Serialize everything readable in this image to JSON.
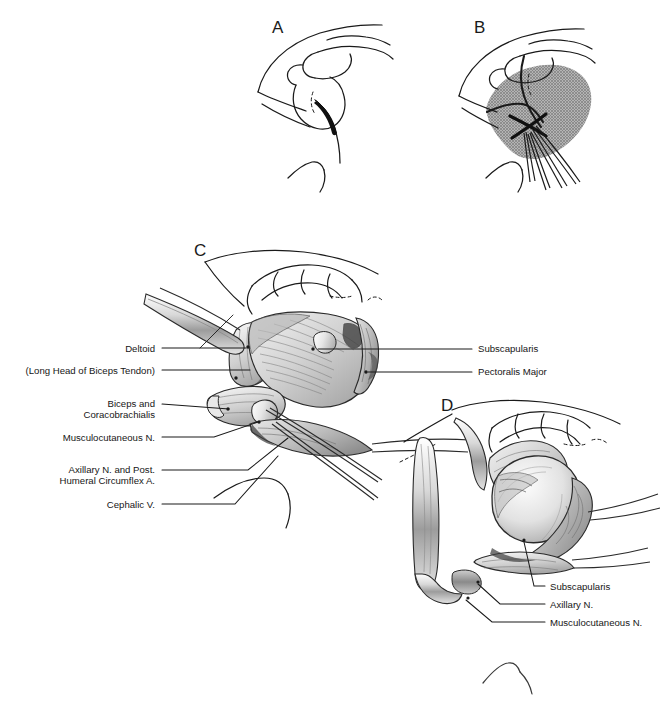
{
  "figure": {
    "background_color": "#ffffff",
    "ink_color": "#1a1a1a",
    "shade_color": "#9a9a9a",
    "width": 665,
    "height": 707
  },
  "panels": [
    {
      "id": "A",
      "letter": "A",
      "x": 272,
      "y": 26,
      "caption": "Skin incision marked over the shoulder"
    },
    {
      "id": "B",
      "letter": "B",
      "x": 474,
      "y": 26,
      "caption": "Shaded exposure field with retractors in the wound"
    },
    {
      "id": "C",
      "letter": "C",
      "x": 200,
      "y": 250,
      "caption": "Deltopectoral interval developed, deep structures exposed"
    },
    {
      "id": "D",
      "letter": "D",
      "x": 448,
      "y": 405,
      "caption": "Humeral head exposed after subscapularis release"
    }
  ],
  "labels_panel_c_left": [
    {
      "text": "Deltoid",
      "x": 12,
      "y": 344,
      "width": 143,
      "align": "right"
    },
    {
      "text": "(Long Head of Biceps Tendon)",
      "x": 0,
      "y": 366,
      "width": 155,
      "align": "right"
    },
    {
      "text": "Biceps and\nCoracobrachialis",
      "x": 0,
      "y": 399,
      "width": 155,
      "align": "right"
    },
    {
      "text": "Musculocutaneous N.",
      "x": 0,
      "y": 433,
      "width": 155,
      "align": "right"
    },
    {
      "text": "Axillary N. and Post.\nHumeral Circumflex A.",
      "x": 0,
      "y": 465,
      "width": 155,
      "align": "right"
    },
    {
      "text": "Cephalic V.",
      "x": 0,
      "y": 500,
      "width": 155,
      "align": "right"
    }
  ],
  "labels_panel_c_right": [
    {
      "text": "Subscapularis",
      "x": 478,
      "y": 344,
      "align": "left"
    },
    {
      "text": "Pectoralis Major",
      "x": 478,
      "y": 367,
      "align": "left"
    }
  ],
  "labels_panel_d": [
    {
      "text": "Subscapularis",
      "x": 550,
      "y": 582,
      "align": "left"
    },
    {
      "text": "Axillary N.",
      "x": 550,
      "y": 600,
      "align": "left"
    },
    {
      "text": "Musculocutaneous N.",
      "x": 550,
      "y": 618,
      "align": "left"
    }
  ]
}
